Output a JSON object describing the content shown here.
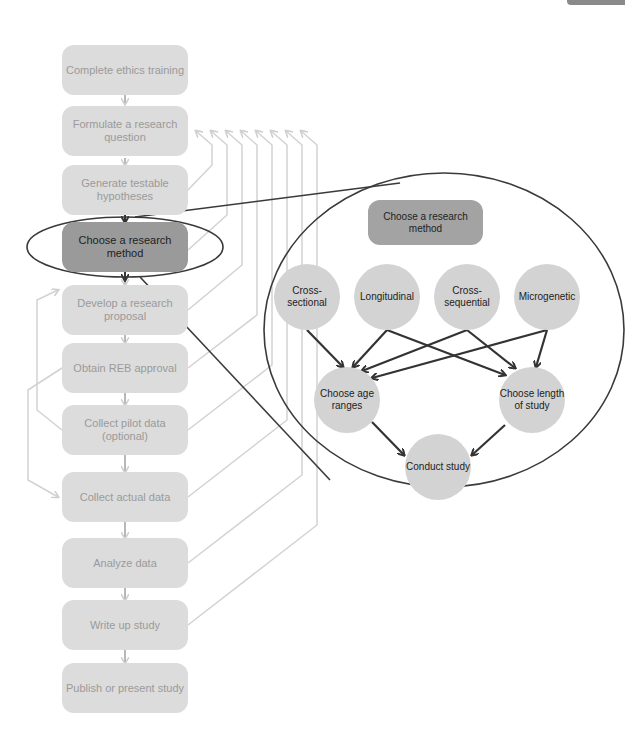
{
  "flowchart": {
    "steps": [
      {
        "label": "Complete ethics training",
        "highlighted": false
      },
      {
        "label": "Formulate a research question",
        "highlighted": false
      },
      {
        "label": "Generate testable hypotheses",
        "highlighted": false
      },
      {
        "label": "Choose a research method",
        "highlighted": true
      },
      {
        "label": "Develop a research proposal",
        "highlighted": false
      },
      {
        "label": "Obtain REB approval",
        "highlighted": false
      },
      {
        "label": "Collect pilot data (optional)",
        "highlighted": false
      },
      {
        "label": "Collect actual data",
        "highlighted": false
      },
      {
        "label": "Analyze data",
        "highlighted": false
      },
      {
        "label": "Write up study",
        "highlighted": false
      },
      {
        "label": "Publish or present study",
        "highlighted": false
      }
    ]
  },
  "zoom_panel": {
    "title": "Choose a research method",
    "methods": [
      {
        "label": "Cross-sectional"
      },
      {
        "label": "Longitudinal"
      },
      {
        "label": "Cross-sequential"
      },
      {
        "label": "Microgenetic"
      }
    ],
    "decisions": [
      {
        "label": "Choose age ranges"
      },
      {
        "label": "Choose length of study"
      }
    ],
    "outcome": {
      "label": "Conduct study"
    }
  },
  "colors": {
    "box_fill": "#dcdcdc",
    "box_text": "#9a9a9a",
    "active_fill": "#9a9a9a",
    "node_fill": "#d3d3d3",
    "feedback_line": "#d0d0d0",
    "arrow_dark": "#333333"
  }
}
